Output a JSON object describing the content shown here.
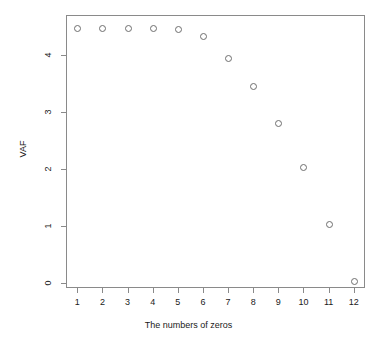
{
  "chart_data": {
    "type": "scatter",
    "title": "",
    "xlabel": "The numbers of zeros",
    "ylabel": "VAF",
    "x": [
      1,
      2,
      3,
      4,
      5,
      6,
      7,
      8,
      9,
      10,
      11,
      12
    ],
    "values": [
      4.47,
      4.47,
      4.47,
      4.47,
      4.46,
      4.33,
      3.94,
      3.46,
      2.8,
      2.03,
      1.03,
      0.04
    ],
    "series": [
      {
        "name": "VAF",
        "values": [
          4.47,
          4.47,
          4.47,
          4.47,
          4.46,
          4.33,
          3.94,
          3.46,
          2.8,
          2.03,
          1.03,
          0.04
        ]
      }
    ],
    "xticks": [
      "1",
      "2",
      "3",
      "4",
      "5",
      "6",
      "7",
      "8",
      "9",
      "10",
      "11",
      "12"
    ],
    "yticks": [
      "0",
      "1",
      "2",
      "3",
      "4"
    ],
    "ytick_values": [
      0,
      1,
      2,
      3,
      4
    ],
    "xlim": [
      0.55,
      12.45
    ],
    "ylim": [
      -0.09,
      4.7
    ],
    "grid": false,
    "legend": false,
    "marker": "open-circle",
    "marker_color": "#6e6e6e",
    "frame_color": "#8a8a8a",
    "background": "#ffffff"
  }
}
